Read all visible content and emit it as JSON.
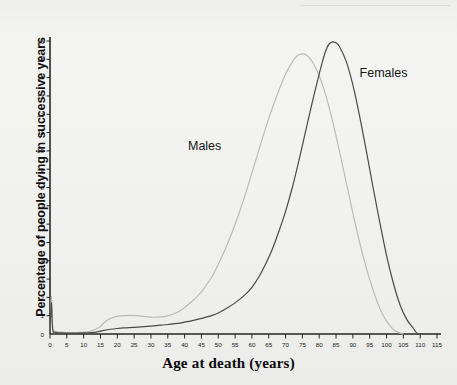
{
  "page": {
    "header_note": "",
    "background_color": "#f1f1ef"
  },
  "chart_data": {
    "type": "line",
    "title": "",
    "xlabel": "Age at death (years)",
    "ylabel": "Percentage of people dying in successive years",
    "xlim": [
      0,
      115
    ],
    "ylim": [
      0,
      16
    ],
    "xticks": [
      0,
      5,
      10,
      15,
      20,
      25,
      30,
      35,
      40,
      45,
      50,
      55,
      60,
      65,
      70,
      75,
      80,
      85,
      90,
      95,
      100,
      105,
      110,
      115
    ],
    "yticks": [
      0,
      1,
      2,
      3,
      4,
      5,
      6,
      7,
      8,
      9,
      10,
      11,
      12,
      13,
      14,
      15,
      16
    ],
    "xtick_labels": [
      "0",
      "5",
      "10",
      "15",
      "20",
      "25",
      "30",
      "35",
      "40",
      "45",
      "50",
      "55",
      "60",
      "65",
      "70",
      "75",
      "80",
      "85",
      "90",
      "95",
      "100",
      "105",
      "110",
      "115"
    ],
    "ytick_labels": [
      "0",
      "1",
      "2",
      "3",
      "4",
      "5",
      "6",
      "7",
      "8",
      "9",
      "10",
      "11",
      "12",
      "13",
      "14",
      "15",
      "16"
    ],
    "grid": false,
    "legend_position": "inline-annotation",
    "series": [
      {
        "name": "Males",
        "color": "#b9b9b9",
        "label_x": 41,
        "label_y": 10.2,
        "points": [
          [
            0,
            0.1
          ],
          [
            0.4,
            2.05
          ],
          [
            0.8,
            0.35
          ],
          [
            1.5,
            0.15
          ],
          [
            3,
            0.1
          ],
          [
            5,
            0.08
          ],
          [
            8,
            0.08
          ],
          [
            10,
            0.1
          ],
          [
            12,
            0.15
          ],
          [
            14,
            0.3
          ],
          [
            15,
            0.42
          ],
          [
            16,
            0.6
          ],
          [
            17,
            0.75
          ],
          [
            18,
            0.85
          ],
          [
            19,
            0.92
          ],
          [
            20,
            0.96
          ],
          [
            22,
            1.0
          ],
          [
            24,
            1.02
          ],
          [
            26,
            1.0
          ],
          [
            28,
            0.95
          ],
          [
            30,
            0.92
          ],
          [
            32,
            0.92
          ],
          [
            34,
            0.95
          ],
          [
            36,
            1.05
          ],
          [
            38,
            1.2
          ],
          [
            40,
            1.45
          ],
          [
            42,
            1.75
          ],
          [
            44,
            2.1
          ],
          [
            45,
            2.3
          ],
          [
            46,
            2.55
          ],
          [
            48,
            3.1
          ],
          [
            50,
            3.8
          ],
          [
            52,
            4.6
          ],
          [
            54,
            5.5
          ],
          [
            56,
            6.5
          ],
          [
            58,
            7.6
          ],
          [
            60,
            8.8
          ],
          [
            62,
            10.0
          ],
          [
            64,
            11.2
          ],
          [
            66,
            12.3
          ],
          [
            68,
            13.3
          ],
          [
            70,
            14.2
          ],
          [
            72,
            14.85
          ],
          [
            73,
            15.1
          ],
          [
            74,
            15.25
          ],
          [
            75,
            15.3
          ],
          [
            76,
            15.25
          ],
          [
            77,
            15.1
          ],
          [
            78,
            14.85
          ],
          [
            80,
            14.1
          ],
          [
            82,
            13.0
          ],
          [
            84,
            11.6
          ],
          [
            86,
            10.0
          ],
          [
            88,
            8.3
          ],
          [
            90,
            6.6
          ],
          [
            92,
            5.0
          ],
          [
            94,
            3.6
          ],
          [
            96,
            2.4
          ],
          [
            98,
            1.4
          ],
          [
            100,
            0.7
          ],
          [
            102,
            0.25
          ],
          [
            104,
            0.05
          ],
          [
            105,
            0.0
          ]
        ]
      },
      {
        "name": "Females",
        "color": "#4a4a4a",
        "label_x": 92,
        "label_y": 14.2,
        "points": [
          [
            0,
            0.08
          ],
          [
            0.4,
            1.7
          ],
          [
            0.8,
            0.25
          ],
          [
            1.5,
            0.1
          ],
          [
            3,
            0.06
          ],
          [
            5,
            0.05
          ],
          [
            8,
            0.05
          ],
          [
            10,
            0.06
          ],
          [
            12,
            0.08
          ],
          [
            14,
            0.12
          ],
          [
            15,
            0.16
          ],
          [
            16,
            0.2
          ],
          [
            18,
            0.26
          ],
          [
            20,
            0.3
          ],
          [
            22,
            0.33
          ],
          [
            25,
            0.36
          ],
          [
            28,
            0.4
          ],
          [
            30,
            0.43
          ],
          [
            33,
            0.48
          ],
          [
            35,
            0.52
          ],
          [
            38,
            0.58
          ],
          [
            40,
            0.65
          ],
          [
            42,
            0.72
          ],
          [
            45,
            0.85
          ],
          [
            48,
            1.0
          ],
          [
            50,
            1.15
          ],
          [
            52,
            1.35
          ],
          [
            55,
            1.7
          ],
          [
            58,
            2.15
          ],
          [
            60,
            2.55
          ],
          [
            62,
            3.1
          ],
          [
            64,
            3.8
          ],
          [
            66,
            4.6
          ],
          [
            68,
            5.6
          ],
          [
            70,
            6.7
          ],
          [
            72,
            8.0
          ],
          [
            74,
            9.5
          ],
          [
            76,
            11.1
          ],
          [
            78,
            12.7
          ],
          [
            80,
            14.2
          ],
          [
            81,
            14.9
          ],
          [
            82,
            15.5
          ],
          [
            83,
            15.85
          ],
          [
            84,
            15.95
          ],
          [
            85,
            15.9
          ],
          [
            86,
            15.7
          ],
          [
            88,
            14.9
          ],
          [
            90,
            13.6
          ],
          [
            92,
            11.9
          ],
          [
            94,
            10.0
          ],
          [
            96,
            8.0
          ],
          [
            98,
            6.1
          ],
          [
            100,
            4.3
          ],
          [
            102,
            2.8
          ],
          [
            104,
            1.6
          ],
          [
            106,
            0.8
          ],
          [
            108,
            0.3
          ],
          [
            109,
            0.05
          ],
          [
            110,
            0.0
          ]
        ]
      }
    ]
  }
}
